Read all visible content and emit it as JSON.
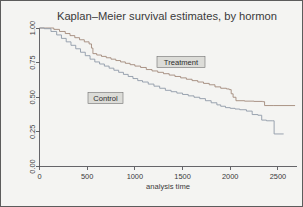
{
  "figure": {
    "title": "Kaplan–Meier survival estimates, by hormon",
    "background_color": "#f4f4f2",
    "border_color": "#5c5c5c"
  },
  "annotations": {
    "treatment_label": "Treatment",
    "control_label": "Control"
  },
  "chart_data": {
    "type": "line",
    "title": "Kaplan–Meier survival estimates, by hormon",
    "subtitle": "",
    "xlabel": "analysis time",
    "ylabel": "",
    "xlim": [
      0,
      2700
    ],
    "ylim": [
      0,
      1.0
    ],
    "xticks": [
      0,
      500,
      1000,
      1500,
      2000,
      2500
    ],
    "xticklabels": [
      "0",
      "500",
      "1000",
      "1500",
      "2000",
      "2500"
    ],
    "yticks": [
      0.0,
      0.25,
      0.5,
      0.75,
      1.0
    ],
    "yticklabels": [
      "0.00",
      "0.25",
      "0.50",
      "0.75",
      "1.00"
    ],
    "grid": false,
    "legend_position": "inline-annotations",
    "step_style": "post",
    "series": [
      {
        "name": "Treatment",
        "color": "#a2897a",
        "label_text": "Treatment",
        "x": [
          0,
          60,
          150,
          210,
          270,
          320,
          370,
          420,
          470,
          520,
          545,
          560,
          600,
          650,
          700,
          750,
          800,
          850,
          900,
          950,
          1000,
          1060,
          1120,
          1180,
          1240,
          1300,
          1360,
          1420,
          1480,
          1540,
          1600,
          1660,
          1720,
          1780,
          1840,
          1900,
          1960,
          1990,
          2010,
          2030,
          2060,
          2150,
          2250,
          2340,
          2360,
          2450,
          2680
        ],
        "y": [
          1.0,
          1.0,
          0.99,
          0.975,
          0.96,
          0.945,
          0.93,
          0.915,
          0.9,
          0.885,
          0.855,
          0.815,
          0.805,
          0.795,
          0.785,
          0.775,
          0.765,
          0.755,
          0.745,
          0.735,
          0.725,
          0.715,
          0.7,
          0.69,
          0.68,
          0.67,
          0.66,
          0.65,
          0.64,
          0.63,
          0.62,
          0.61,
          0.6,
          0.59,
          0.575,
          0.565,
          0.56,
          0.555,
          0.525,
          0.5,
          0.475,
          0.472,
          0.47,
          0.468,
          0.44,
          0.44,
          0.44
        ]
      },
      {
        "name": "Control",
        "color": "#8e9aa8",
        "label_text": "Control",
        "x": [
          0,
          50,
          120,
          180,
          230,
          280,
          330,
          380,
          430,
          480,
          530,
          580,
          630,
          680,
          730,
          780,
          830,
          880,
          930,
          980,
          1030,
          1080,
          1140,
          1200,
          1260,
          1320,
          1380,
          1440,
          1500,
          1560,
          1620,
          1680,
          1740,
          1800,
          1860,
          1900,
          1950,
          2000,
          2050,
          2100,
          2170,
          2230,
          2290,
          2330,
          2380,
          2440,
          2460,
          2560
        ],
        "y": [
          1.0,
          0.995,
          0.975,
          0.95,
          0.925,
          0.9,
          0.875,
          0.85,
          0.825,
          0.8,
          0.775,
          0.755,
          0.74,
          0.725,
          0.71,
          0.695,
          0.68,
          0.665,
          0.65,
          0.635,
          0.62,
          0.61,
          0.595,
          0.58,
          0.565,
          0.55,
          0.54,
          0.53,
          0.52,
          0.51,
          0.5,
          0.49,
          0.475,
          0.46,
          0.445,
          0.435,
          0.425,
          0.42,
          0.415,
          0.41,
          0.4,
          0.375,
          0.37,
          0.335,
          0.33,
          0.33,
          0.235,
          0.235
        ]
      }
    ]
  }
}
